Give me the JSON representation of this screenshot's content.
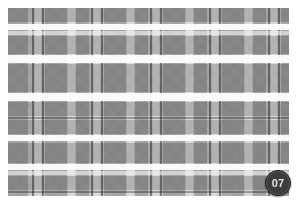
{
  "swatch": {
    "title": "Plaid Fabric Swatch",
    "pattern_name": "grey-tartan-check",
    "canvas": {
      "width": 297,
      "height": 204,
      "background": "#ffffff"
    },
    "plate": {
      "x": 8,
      "y": 8,
      "width": 281,
      "height": 188
    },
    "colors": {
      "base": "#c9c9c9",
      "band": "#a9a9a9",
      "overlap": "#8e8e8e",
      "pinstripe": "#6f6f6f",
      "highlight": "#fdfdfd",
      "light": "#efefef",
      "badge_fill": "#3c3c3c",
      "badge_text": "#e2e2e2",
      "page_background": "#ffffff"
    },
    "warp_stripes": [
      {
        "name": "band-1",
        "x": 0,
        "width": 20,
        "kind": "band"
      },
      {
        "name": "pin-1",
        "x": 24,
        "width": 2,
        "kind": "pin"
      },
      {
        "name": "light-1",
        "x": 27,
        "width": 6,
        "kind": "light"
      },
      {
        "name": "pin-2",
        "x": 34,
        "width": 2,
        "kind": "pin"
      },
      {
        "name": "band-2",
        "x": 37,
        "width": 22,
        "kind": "band"
      },
      {
        "name": "light-2",
        "x": 60,
        "width": 7,
        "kind": "light"
      },
      {
        "name": "band-3",
        "x": 68,
        "width": 13,
        "kind": "band"
      },
      {
        "name": "pin-3",
        "x": 83,
        "width": 2,
        "kind": "pin"
      },
      {
        "name": "light-3",
        "x": 86,
        "width": 6,
        "kind": "light"
      },
      {
        "name": "pin-4",
        "x": 93,
        "width": 2,
        "kind": "pin"
      },
      {
        "name": "band-4",
        "x": 96,
        "width": 22,
        "kind": "band"
      },
      {
        "name": "light-4",
        "x": 119,
        "width": 7,
        "kind": "light"
      },
      {
        "name": "band-5",
        "x": 127,
        "width": 13,
        "kind": "band"
      },
      {
        "name": "pin-5",
        "x": 142,
        "width": 2,
        "kind": "pin"
      },
      {
        "name": "light-5",
        "x": 145,
        "width": 6,
        "kind": "light"
      },
      {
        "name": "pin-6",
        "x": 152,
        "width": 2,
        "kind": "pin"
      },
      {
        "name": "band-6",
        "x": 155,
        "width": 22,
        "kind": "band"
      },
      {
        "name": "light-6",
        "x": 178,
        "width": 7,
        "kind": "light"
      },
      {
        "name": "band-7",
        "x": 186,
        "width": 13,
        "kind": "band"
      },
      {
        "name": "pin-7",
        "x": 201,
        "width": 2,
        "kind": "pin"
      },
      {
        "name": "light-7",
        "x": 204,
        "width": 6,
        "kind": "light"
      },
      {
        "name": "pin-8",
        "x": 211,
        "width": 2,
        "kind": "pin"
      },
      {
        "name": "band-8",
        "x": 214,
        "width": 22,
        "kind": "band"
      },
      {
        "name": "light-8",
        "x": 237,
        "width": 7,
        "kind": "light"
      },
      {
        "name": "band-9",
        "x": 245,
        "width": 13,
        "kind": "band"
      },
      {
        "name": "pin-9",
        "x": 260,
        "width": 2,
        "kind": "pin"
      },
      {
        "name": "light-9",
        "x": 263,
        "width": 6,
        "kind": "light"
      },
      {
        "name": "pin-10",
        "x": 270,
        "width": 2,
        "kind": "pin"
      },
      {
        "name": "band-10",
        "x": 273,
        "width": 8,
        "kind": "band"
      }
    ],
    "weft_stripes": [
      {
        "name": "band-a",
        "y": 0,
        "height": 14,
        "kind": "band"
      },
      {
        "name": "white-a",
        "y": 16,
        "height": 6,
        "kind": "white"
      },
      {
        "name": "lightw-a",
        "y": 23,
        "height": 4,
        "kind": "light"
      },
      {
        "name": "band-b",
        "y": 28,
        "height": 18,
        "kind": "band"
      },
      {
        "name": "white-b",
        "y": 47,
        "height": 8,
        "kind": "white"
      },
      {
        "name": "band-c",
        "y": 56,
        "height": 28,
        "kind": "band"
      },
      {
        "name": "white-c",
        "y": 85,
        "height": 8,
        "kind": "white"
      },
      {
        "name": "band-d",
        "y": 94,
        "height": 14,
        "kind": "band"
      },
      {
        "name": "pinw-a",
        "y": 109,
        "height": 2,
        "kind": "pin"
      },
      {
        "name": "band-e",
        "y": 112,
        "height": 14,
        "kind": "band"
      },
      {
        "name": "white-d",
        "y": 127,
        "height": 6,
        "kind": "white"
      },
      {
        "name": "band-f",
        "y": 135,
        "height": 20,
        "kind": "band"
      },
      {
        "name": "white-e",
        "y": 156,
        "height": 6,
        "kind": "white"
      },
      {
        "name": "lightw-b",
        "y": 163,
        "height": 4,
        "kind": "light"
      },
      {
        "name": "band-g",
        "y": 168,
        "height": 14,
        "kind": "band"
      },
      {
        "name": "pinw-b",
        "y": 183,
        "height": 2,
        "kind": "pin"
      }
    ]
  },
  "badge": {
    "label": "07",
    "x": 265,
    "y": 170,
    "diameter": 24
  }
}
